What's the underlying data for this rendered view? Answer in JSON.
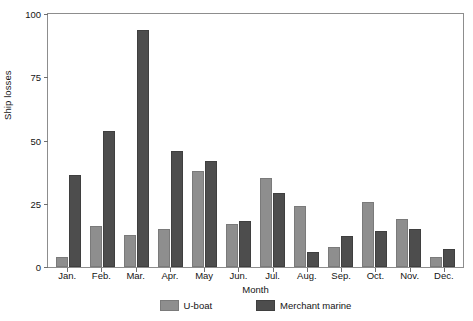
{
  "chart_data": {
    "type": "bar",
    "title": "",
    "xlabel": "Month",
    "ylabel": "Ship losses",
    "categories": [
      "Jan.",
      "Feb.",
      "Mar.",
      "Apr.",
      "May",
      "Jun.",
      "Jul.",
      "Aug.",
      "Sep.",
      "Oct.",
      "Nov.",
      "Dec."
    ],
    "series": [
      {
        "name": "U-boat",
        "color": "#8e8e8e",
        "values": [
          4,
          16,
          12.5,
          15,
          37.5,
          17,
          35,
          24,
          8,
          25.5,
          19,
          4
        ]
      },
      {
        "name": "Merchant marine",
        "color": "#4d4d4d",
        "values": [
          36,
          53.5,
          93,
          45.5,
          41.5,
          18,
          29,
          6,
          12,
          14,
          15,
          7
        ]
      }
    ],
    "ylim": [
      0,
      100
    ],
    "yticks": [
      "0",
      "25",
      "50",
      "75",
      "100"
    ],
    "ytick_values": [
      0,
      25,
      50,
      75,
      100
    ],
    "grid": false,
    "legend_position": "bottom"
  }
}
